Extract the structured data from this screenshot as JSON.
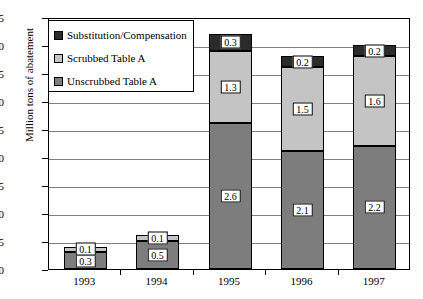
{
  "chart_data": {
    "type": "bar",
    "stacked": true,
    "title": "",
    "xlabel": "",
    "ylabel": "Million tons of abatement",
    "categories": [
      "1993",
      "1994",
      "1995",
      "1996",
      "1997"
    ],
    "ylim": [
      0.0,
      4.5
    ],
    "yticks": [
      "0.0",
      "0.5",
      "1.0",
      "1.5",
      "2.0",
      "2.5",
      "3.0",
      "3.5",
      "4.0",
      "4.5"
    ],
    "ytick_values": [
      0.0,
      0.5,
      1.0,
      1.5,
      2.0,
      2.5,
      3.0,
      3.5,
      4.0,
      4.5
    ],
    "grid": true,
    "legend_position": "upper-left",
    "series": [
      {
        "name": "Unscrubbed Table A",
        "color": "#7d7d7d",
        "values": [
          0.3,
          0.5,
          2.6,
          2.1,
          2.2
        ],
        "labels": [
          "0.3",
          "0.5",
          "2.6",
          "2.1",
          "2.2"
        ]
      },
      {
        "name": "Scrubbed Table A",
        "color": "#c4c4c4",
        "values": [
          0.1,
          0.1,
          1.3,
          1.5,
          1.6
        ],
        "labels": [
          "0.1",
          "0.1",
          "1.3",
          "1.5",
          "1.6"
        ]
      },
      {
        "name": "Substitution/Compensation",
        "color": "#2b2b2b",
        "values": [
          0.0,
          0.0,
          0.3,
          0.2,
          0.2
        ],
        "labels": [
          "",
          "",
          "0.3",
          "0.2",
          "0.2"
        ]
      }
    ],
    "totals": [
      0.4,
      0.6,
      4.2,
      3.8,
      4.0
    ]
  },
  "legend": {
    "items": [
      {
        "label": "Substitution/Compensation",
        "color": "#2b2b2b"
      },
      {
        "label": "Scrubbed Table A",
        "color": "#c4c4c4"
      },
      {
        "label": "Unscrubbed Table A",
        "color": "#7d7d7d"
      }
    ]
  },
  "axis": {
    "y_title": "Million tons of abatement"
  }
}
